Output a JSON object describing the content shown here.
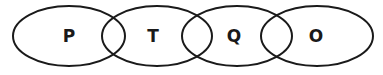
{
  "diagram": {
    "type": "chained-overlapping-ellipses",
    "sets": [
      {
        "label": "P"
      },
      {
        "label": "T"
      },
      {
        "label": "Q"
      },
      {
        "label": "O"
      }
    ],
    "overlaps": [
      [
        "P",
        "T"
      ],
      [
        "T",
        "Q"
      ],
      [
        "Q",
        "O"
      ]
    ]
  }
}
